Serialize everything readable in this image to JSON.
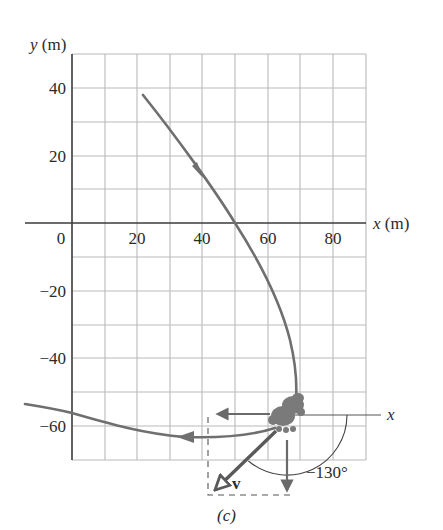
{
  "figure": {
    "caption": "(c)",
    "x_axis_label": "x (m)",
    "y_axis_label": "y (m)",
    "x_ticks": [
      {
        "label": "0",
        "value": 0
      },
      {
        "label": "20",
        "value": 20
      },
      {
        "label": "40",
        "value": 40
      },
      {
        "label": "60",
        "value": 60
      },
      {
        "label": "80",
        "value": 80
      }
    ],
    "y_ticks": [
      {
        "label": "40",
        "value": 40
      },
      {
        "label": "20",
        "value": 20
      },
      {
        "label": "−20",
        "value": -20
      },
      {
        "label": "−40",
        "value": -40
      },
      {
        "label": "−60",
        "value": -60
      }
    ],
    "grid": {
      "x_min": 0,
      "x_max": 90,
      "y_min": -70,
      "y_max": 50,
      "step": 10
    },
    "local_axis_label": "x",
    "velocity_label": "v",
    "angle_label": "−130°",
    "angle_degrees": -130,
    "subject_icon": "rabbit-icon",
    "colors": {
      "grid": "#b9b9b9",
      "axis": "#3a3a3a",
      "path": "#6f6f6f",
      "vector": "#5a5a5a",
      "rabbit": "#7a7a7a"
    }
  }
}
